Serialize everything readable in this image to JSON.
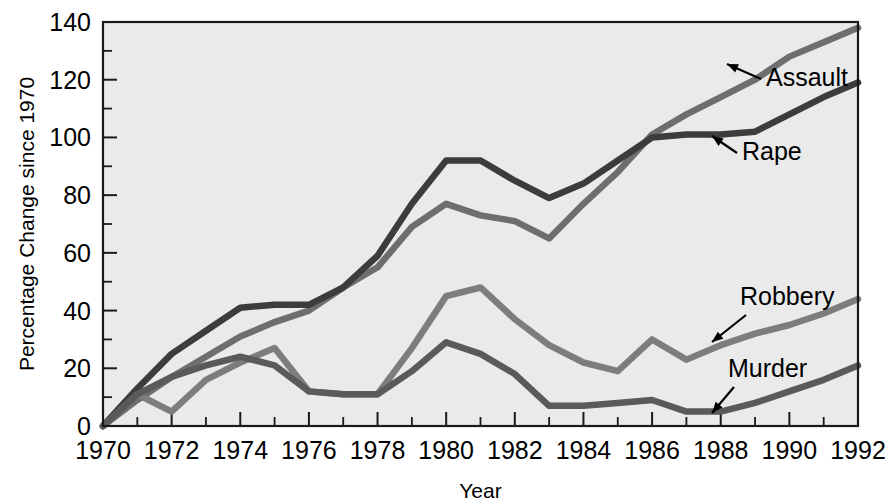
{
  "chart_data": {
    "type": "line",
    "title": "",
    "xlabel": "Year",
    "ylabel": "Percentage Change since 1970",
    "xlim": [
      1970,
      1992
    ],
    "ylim": [
      0,
      140
    ],
    "grid": false,
    "legend_position": "inline-annotations",
    "x": [
      1970,
      1971,
      1972,
      1973,
      1974,
      1975,
      1976,
      1977,
      1978,
      1979,
      1980,
      1981,
      1982,
      1983,
      1984,
      1985,
      1986,
      1987,
      1988,
      1989,
      1990,
      1991,
      1992
    ],
    "xticks": [
      1970,
      1972,
      1974,
      1976,
      1978,
      1980,
      1982,
      1984,
      1986,
      1988,
      1990,
      1992
    ],
    "xtick_labels": [
      "1970",
      "1972",
      "1974",
      "1976",
      "1978",
      "1980",
      "1982",
      "1984",
      "1986",
      "1988",
      "1990",
      "1992"
    ],
    "yticks": [
      0,
      20,
      40,
      60,
      80,
      100,
      120,
      140
    ],
    "ytick_labels": [
      "0",
      "20",
      "40",
      "60",
      "80",
      "100",
      "120",
      "140"
    ],
    "yminor_ticks": [
      10,
      30,
      50,
      70,
      90,
      110,
      130
    ],
    "series": [
      {
        "name": "Assault",
        "color": "#6e6e6e",
        "label": "Assault",
        "values": [
          0,
          9,
          17,
          24,
          31,
          36,
          40,
          48,
          55,
          69,
          77,
          73,
          71,
          65,
          77,
          88,
          101,
          108,
          114,
          120,
          128,
          133,
          138
        ]
      },
      {
        "name": "Rape",
        "color": "#3c3c3c",
        "label": "Rape",
        "values": [
          0,
          13,
          25,
          33,
          41,
          42,
          42,
          48,
          59,
          77,
          92,
          92,
          85,
          79,
          84,
          92,
          100,
          101,
          101,
          102,
          108,
          114,
          119
        ]
      },
      {
        "name": "Robbery",
        "color": "#7d7d7d",
        "label": "Robbery",
        "values": [
          0,
          11,
          5,
          16,
          22,
          27,
          12,
          11,
          11,
          27,
          45,
          48,
          37,
          28,
          22,
          19,
          30,
          23,
          28,
          32,
          35,
          39,
          44
        ]
      },
      {
        "name": "Murder",
        "color": "#5a5a5a",
        "label": "Murder",
        "values": [
          0,
          11,
          17,
          21,
          24,
          21,
          12,
          11,
          11,
          19,
          29,
          25,
          18,
          7,
          7,
          8,
          9,
          5,
          5,
          8,
          12,
          16,
          21
        ]
      }
    ],
    "annotations": [
      {
        "label": "Assault",
        "series": "Assault",
        "text_x": 766,
        "text_y": 86,
        "arrow_from_x": 761,
        "arrow_from_y": 79,
        "arrow_to_x": 727,
        "arrow_to_y": 64
      },
      {
        "label": "Rape",
        "series": "Rape",
        "text_x": 742,
        "text_y": 160,
        "arrow_from_x": 737,
        "arrow_from_y": 153,
        "arrow_to_x": 712,
        "arrow_to_y": 136
      },
      {
        "label": "Robbery",
        "series": "Robbery",
        "text_x": 740,
        "text_y": 305,
        "arrow_from_x": 746,
        "arrow_from_y": 315,
        "arrow_to_x": 712,
        "arrow_to_y": 342
      },
      {
        "label": "Murder",
        "series": "Murder",
        "text_x": 728,
        "text_y": 377,
        "arrow_from_x": 734,
        "arrow_from_y": 387,
        "arrow_to_x": 712,
        "arrow_to_y": 413
      }
    ],
    "colors": {
      "plot_background": "#eaeaea",
      "page_background": "#ffffff",
      "axis": "#1a1a1a",
      "text": "#000000"
    }
  }
}
